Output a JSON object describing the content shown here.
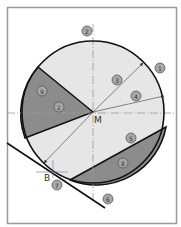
{
  "diagram": {
    "type": "geometry-circle-tangent",
    "colors": {
      "background": "#ffffff",
      "frame": "#9a9a9a",
      "circle_fill_light": "#e6e6e6",
      "segment_fill_dark": "#8c8c8c",
      "outline": "#111111",
      "axis": "#9a9a9a",
      "arrow": "#555555",
      "badge_fill": "#a8a8a8",
      "badge_stroke": "#555555"
    },
    "points": {
      "center": {
        "label": "M",
        "x": 93,
        "y": 112
      },
      "tangent_point": {
        "label": "B",
        "x": 46,
        "y": 172
      }
    },
    "badges": [
      {
        "id": "badge-1",
        "text": "1",
        "x": 160,
        "y": 68
      },
      {
        "id": "badge-2-top",
        "text": "2",
        "x": 87,
        "y": 31
      },
      {
        "id": "badge-3",
        "text": "3",
        "x": 117,
        "y": 80
      },
      {
        "id": "badge-4",
        "text": "4",
        "x": 136,
        "y": 96
      },
      {
        "id": "badge-9",
        "text": "9",
        "x": 42,
        "y": 91
      },
      {
        "id": "badge-2-left",
        "text": "2",
        "x": 59,
        "y": 107
      },
      {
        "id": "badge-5",
        "text": "5",
        "x": 131,
        "y": 138
      },
      {
        "id": "badge-8",
        "text": "8",
        "x": 123,
        "y": 163
      },
      {
        "id": "badge-7",
        "text": "7",
        "x": 57,
        "y": 185
      },
      {
        "id": "badge-6",
        "text": "6",
        "x": 108,
        "y": 199
      }
    ]
  }
}
